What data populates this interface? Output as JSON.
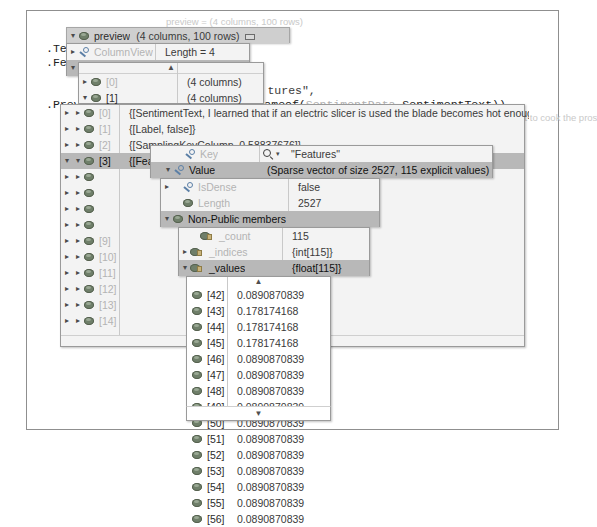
{
  "window": {
    "app": "visual-studio-debugger-datatip"
  },
  "code": {
    "lines": [
      {
        "text": "var preview = mlContext",
        "x": 30,
        "y": 14
      },
      {
        "text": ".Te:",
        "x": 46,
        "y": 43
      },
      {
        "text": ".Fe:",
        "x": 46,
        "y": 57
      },
      {
        "text": ".Prev:",
        "x": 46,
        "y": 99
      }
    ],
    "fragments": [
      {
        "text": "tures\",",
        "x": 226,
        "y": 72
      },
      {
        "text": "nameof(SentimentData.SentimentText))",
        "x": 216,
        "y": 86
      },
      {
        "text": "1",
        "x": 159,
        "y": 86
      }
    ],
    "inline_hint": "preview = (4 columns, 100 rows)"
  },
  "datatip_root": {
    "label": "preview",
    "value": "(4 columns, 100 rows)",
    "pin_icon": "pin-icon"
  },
  "panel_columnview_rowview": {
    "rows": [
      {
        "expander": "▸",
        "icon": "property-icon",
        "label": "ColumnView",
        "value": "Length = 4",
        "selected": false,
        "dim": true
      },
      {
        "expander": "▾",
        "icon": "property-icon",
        "label": "RowView",
        "value": "Length = 100",
        "selected": true,
        "dim": false
      }
    ]
  },
  "panel_rowview_items": {
    "scroll_up": "▲",
    "rows": [
      {
        "expander": "▸",
        "icon": "field-icon",
        "label": "[0]",
        "value": "(4 columns)",
        "dim": true
      },
      {
        "expander": "▾",
        "icon": "field-icon",
        "label": "[1]",
        "value": "(4 columns)",
        "dim": false
      }
    ]
  },
  "panel_row1_members": {
    "rows": [
      {
        "expander": "▸",
        "icon": "field-icon",
        "label": "[0]",
        "value": "{[SentimentText, I learned that if an electric slicer is used the blade becomes hot enough to start to cook the pros",
        "dim": true
      },
      {
        "expander": "▸",
        "icon": "field-icon",
        "label": "[1]",
        "value": "{[Label, false]}",
        "dim": true
      },
      {
        "expander": "▸",
        "icon": "field-icon",
        "label": "[2]",
        "value": "{[SamplingKeyColumn, 0.58837676]}",
        "dim": true
      },
      {
        "expander": "▾",
        "icon": "field-icon",
        "label": "[3]",
        "value": "{[Features, (Sparse vector of size 2527, 115 explicit values)]}",
        "dim": false,
        "selected": true
      },
      {
        "expander": "▸",
        "icon": "field-icon",
        "label": "",
        "value": "",
        "dim": true
      },
      {
        "expander": "▸",
        "icon": "field-icon",
        "label": "",
        "value": "",
        "dim": true
      },
      {
        "expander": "▸",
        "icon": "field-icon",
        "label": "",
        "value": "",
        "dim": true
      },
      {
        "expander": "▸",
        "icon": "field-icon",
        "label": "",
        "value": "",
        "dim": true
      },
      {
        "expander": "▸",
        "icon": "field-icon",
        "label": "[9]",
        "value": "",
        "dim": true
      },
      {
        "expander": "▸",
        "icon": "field-icon",
        "label": "[10]",
        "value": "",
        "dim": true
      },
      {
        "expander": "▸",
        "icon": "field-icon",
        "label": "[11]",
        "value": "",
        "dim": true
      },
      {
        "expander": "▸",
        "icon": "field-icon",
        "label": "[12]",
        "value": "",
        "dim": true
      },
      {
        "expander": "▸",
        "icon": "field-icon",
        "label": "[13]",
        "value": "",
        "dim": true
      },
      {
        "expander": "▸",
        "icon": "field-icon",
        "label": "[14]",
        "value": "",
        "dim": true
      }
    ],
    "scroll_down": "▾"
  },
  "panel_keyvalue": {
    "rows": [
      {
        "expander": "",
        "icon": "property-icon",
        "label": "Key",
        "search_icon": "magnifier-icon",
        "caret_icon": "chevron-down-icon",
        "value": "\"Features\"",
        "dim": true
      },
      {
        "expander": "▾",
        "icon": "property-icon",
        "label": "Value",
        "value": "(Sparse vector of size 2527, 115 explicit values)",
        "selected": true,
        "dim": false
      }
    ]
  },
  "panel_value_members": {
    "rows": [
      {
        "expander": "▸",
        "icon": "property-icon",
        "label": "IsDense",
        "value": "false",
        "dim": true
      },
      {
        "expander": "",
        "icon": "field-icon",
        "label": "Length",
        "value": "2527",
        "dim": true
      },
      {
        "expander": "▾",
        "icon": "field-icon",
        "label": "Non-Public members",
        "value": "",
        "selected": true,
        "dim": false
      }
    ]
  },
  "panel_nonpublic": {
    "rows": [
      {
        "expander": "",
        "icon": "private-field-icon",
        "label": "_count",
        "value": "115",
        "dim": true
      },
      {
        "expander": "▸",
        "icon": "private-field-icon",
        "label": "_indices",
        "value": "{int[115]}",
        "dim": true
      },
      {
        "expander": "▾",
        "icon": "private-field-icon",
        "label": "_values",
        "value": "{float[115]}",
        "selected": true,
        "dim": false
      }
    ]
  },
  "panel_values_list": {
    "scroll_up": "▲",
    "scroll_down": "▼",
    "rows": [
      {
        "icon": "field-icon",
        "index": "[42]",
        "value": "0.0890870839"
      },
      {
        "icon": "field-icon",
        "index": "[43]",
        "value": "0.178174168"
      },
      {
        "icon": "field-icon",
        "index": "[44]",
        "value": "0.178174168"
      },
      {
        "icon": "field-icon",
        "index": "[45]",
        "value": "0.178174168"
      },
      {
        "icon": "field-icon",
        "index": "[46]",
        "value": "0.0890870839"
      },
      {
        "icon": "field-icon",
        "index": "[47]",
        "value": "0.0890870839"
      },
      {
        "icon": "field-icon",
        "index": "[48]",
        "value": "0.0890870839"
      },
      {
        "icon": "field-icon",
        "index": "[49]",
        "value": "0.0890870839"
      },
      {
        "icon": "field-icon",
        "index": "[50]",
        "value": "0.0890870839"
      },
      {
        "icon": "field-icon",
        "index": "[51]",
        "value": "0.0890870839"
      },
      {
        "icon": "field-icon",
        "index": "[52]",
        "value": "0.0890870839"
      },
      {
        "icon": "field-icon",
        "index": "[53]",
        "value": "0.0890870839"
      },
      {
        "icon": "field-icon",
        "index": "[54]",
        "value": "0.0890870839"
      },
      {
        "icon": "field-icon",
        "index": "[55]",
        "value": "0.0890870839"
      },
      {
        "icon": "field-icon",
        "index": "[56]",
        "value": "0.0890870839"
      }
    ]
  },
  "ghost_text": {
    "long_string": "I learned that if an electric slicer is used the blade becomes hot enough to start to cook the pros",
    "explicit_tail": "licit values]}",
    "mns": "mns)"
  },
  "colors": {
    "selection": "#b8b8b8",
    "panel_bg": "#f3f3f3",
    "panel_border": "#9a9a9a",
    "text": "#2b2b2b",
    "dim_text": "#b4b4b4"
  }
}
